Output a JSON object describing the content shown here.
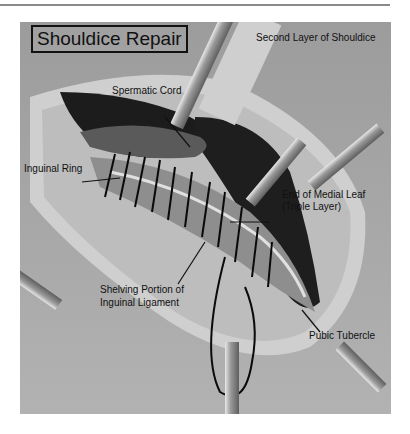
{
  "figure": {
    "title": "Shouldice Repair",
    "subtitle": "Second Layer of Shouldice",
    "labels": {
      "spermatic_cord": "Spermatic Cord",
      "inguinal_ring": "Inguinal Ring",
      "end_medial_leaf_line1": "End of Medial Leaf",
      "end_medial_leaf_line2": "(Triple Layer)",
      "shelving_line1": "Shelving Portion of",
      "shelving_line2": "Inguinal Ligament",
      "pubic_tubercle": "Pubic Tubercle"
    },
    "colors": {
      "background": "#a9a9a9",
      "wound_dark": "#1c1c1c",
      "tissue_light": "#d4d4d4",
      "suture": "#0a0a0a",
      "retractor": "#8c8c8c"
    }
  }
}
